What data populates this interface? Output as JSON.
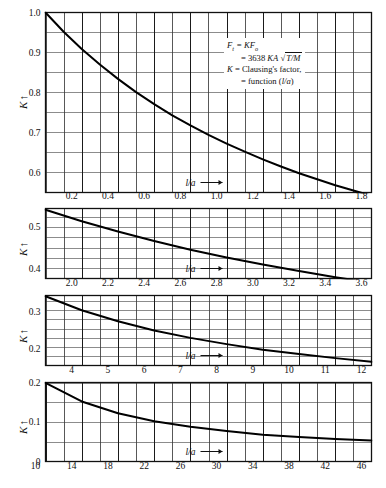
{
  "figure": {
    "annotation": {
      "line1_lhs": "F",
      "line1_lhs_sub": "t",
      "line1_eq": " = KF",
      "line1_sub2": "o",
      "line2": "= 3638 KA √T/M",
      "line3": "K = Clausing's factor,",
      "line4": "= function (l/a)"
    },
    "axis_label_y": "K",
    "axis_label_x": "l/a"
  },
  "chart_data": {
    "type": "line",
    "ylabel": "K",
    "xlabel": "l/a",
    "grid": true,
    "legend": "none",
    "annotations": [
      "F_t = KF_o",
      "= 3638 KA sqrt(T/M)",
      "K = Clausing's factor,",
      "= function (l/a)"
    ],
    "panels": [
      {
        "index": 1,
        "xlim": [
          0,
          1.8
        ],
        "ylim": [
          0.55,
          1.0
        ],
        "xticks": [
          0.2,
          0.4,
          0.6,
          0.8,
          1.0,
          1.2,
          1.4,
          1.6,
          1.8
        ],
        "xticklabels": [
          "0.2",
          "0.4",
          "0.6",
          "0.8",
          "1.0",
          "1.2",
          "1.4",
          "1.6",
          "1.8"
        ],
        "yticks": [
          0.6,
          0.7,
          0.8,
          0.9,
          1.0
        ],
        "yticklabels": [
          "0.6",
          "0.7",
          "0.8",
          "0.9",
          "1.0"
        ],
        "x_minor_step": 0.1,
        "y_minor_step": 0.05,
        "x": [
          0,
          0.1,
          0.2,
          0.3,
          0.4,
          0.5,
          0.6,
          0.7,
          0.8,
          0.9,
          1.0,
          1.1,
          1.2,
          1.3,
          1.4,
          1.5,
          1.6,
          1.7,
          1.8
        ],
        "y": [
          1.0,
          0.952,
          0.909,
          0.87,
          0.834,
          0.801,
          0.771,
          0.743,
          0.718,
          0.694,
          0.672,
          0.652,
          0.633,
          0.615,
          0.598,
          0.583,
          0.568,
          0.555,
          0.542
        ]
      },
      {
        "index": 2,
        "xlim": [
          1.8,
          3.6
        ],
        "ylim": [
          0.375,
          0.545
        ],
        "xticks": [
          2.0,
          2.2,
          2.4,
          2.6,
          2.8,
          3.0,
          3.2,
          3.4,
          3.6
        ],
        "xticklabels": [
          "2.0",
          "2.2",
          "2.4",
          "2.6",
          "2.8",
          "3.0",
          "3.2",
          "3.4",
          "3.6"
        ],
        "yticks": [
          0.4,
          0.5
        ],
        "yticklabels": [
          "0.4",
          "0.5"
        ],
        "x_minor_step": 0.1,
        "y_minor_step": 0.025,
        "x": [
          1.8,
          2.0,
          2.2,
          2.4,
          2.6,
          2.8,
          3.0,
          3.2,
          3.4,
          3.6
        ],
        "y": [
          0.542,
          0.514,
          0.489,
          0.466,
          0.445,
          0.426,
          0.409,
          0.393,
          0.378,
          0.365
        ]
      },
      {
        "index": 3,
        "xlim": [
          3,
          12
        ],
        "ylim": [
          0.155,
          0.345
        ],
        "xticks": [
          4,
          5,
          6,
          7,
          8,
          9,
          10,
          11,
          12
        ],
        "xticklabels": [
          "4",
          "5",
          "6",
          "7",
          "8",
          "9",
          "10",
          "11",
          "12"
        ],
        "yticks": [
          0.2,
          0.3
        ],
        "yticklabels": [
          "0.2",
          "0.3"
        ],
        "x_minor_step": 0.5,
        "y_minor_step": 0.025,
        "x": [
          3,
          4,
          5,
          6,
          7,
          8,
          9,
          10,
          11,
          12
        ],
        "y": [
          0.343,
          0.305,
          0.275,
          0.25,
          0.23,
          0.213,
          0.198,
          0.186,
          0.175,
          0.165
        ]
      },
      {
        "index": 4,
        "xlim": [
          10,
          46
        ],
        "ylim": [
          0,
          0.2
        ],
        "xticks": [
          10,
          14,
          18,
          22,
          26,
          30,
          34,
          38,
          42,
          46
        ],
        "xticklabels": [
          "10",
          "14",
          "18",
          "22",
          "26",
          "30",
          "34",
          "38",
          "42",
          "46"
        ],
        "yticks": [
          0,
          0.1,
          0.2
        ],
        "yticklabels": [
          "0",
          "0.1",
          "0.2"
        ],
        "x_minor_step": 2,
        "y_minor_step": 0.05,
        "x": [
          10,
          14,
          18,
          22,
          26,
          30,
          34,
          38,
          42,
          46
        ],
        "y": [
          0.199,
          0.152,
          0.122,
          0.102,
          0.088,
          0.077,
          0.068,
          0.062,
          0.057,
          0.053
        ]
      }
    ]
  }
}
